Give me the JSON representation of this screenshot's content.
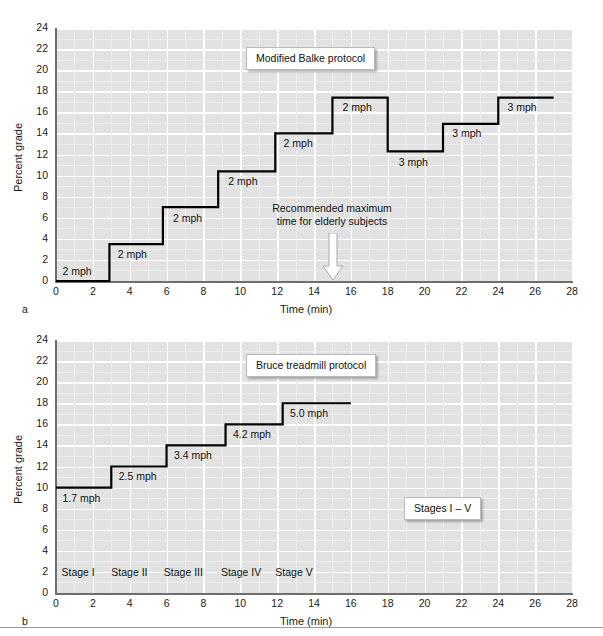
{
  "figure": {
    "width": 603,
    "height": 636,
    "background": "#ffffff",
    "plot_background": "#e2e2e2",
    "grid_color": "#ffffff",
    "line_color": "#000000",
    "axis_color": "#6e6e6e"
  },
  "panels": [
    {
      "id": "a",
      "letter": "a",
      "callout": "Modified Balke protocol",
      "annotation": {
        "line1": "Recommended maximum",
        "line2": "time for elderly subjects",
        "arrow": "down-arrow-icon",
        "at_minute": 15
      },
      "chart_data": {
        "type": "line",
        "subtype": "step",
        "title": "Modified Balke protocol",
        "xlabel": "Time (min)",
        "ylabel": "Percent grade",
        "xlim": [
          0,
          28
        ],
        "ylim": [
          0,
          24
        ],
        "xticks": [
          0,
          2,
          4,
          6,
          8,
          10,
          12,
          14,
          16,
          18,
          20,
          22,
          24,
          26,
          28
        ],
        "yticks": [
          0,
          2,
          4,
          6,
          8,
          10,
          12,
          14,
          16,
          18,
          20,
          22,
          24
        ],
        "grid": true,
        "legend": "none",
        "steps": [
          {
            "t_start": 0.0,
            "t_end": 2.9,
            "grade": 0.0,
            "speed": "2 mph"
          },
          {
            "t_start": 2.9,
            "t_end": 5.8,
            "grade": 3.5,
            "speed": "2 mph"
          },
          {
            "t_start": 5.8,
            "t_end": 8.8,
            "grade": 7.0,
            "speed": "2 mph"
          },
          {
            "t_start": 8.8,
            "t_end": 11.9,
            "grade": 10.4,
            "speed": "2 mph"
          },
          {
            "t_start": 11.9,
            "t_end": 15.0,
            "grade": 14.0,
            "speed": "2 mph"
          },
          {
            "t_start": 15.0,
            "t_end": 18.0,
            "grade": 17.4,
            "speed": "2 mph"
          },
          {
            "t_start": 18.0,
            "t_end": 21.0,
            "grade": 12.3,
            "speed": "3 mph"
          },
          {
            "t_start": 21.0,
            "t_end": 24.0,
            "grade": 14.9,
            "speed": "3 mph"
          },
          {
            "t_start": 24.0,
            "t_end": 27.0,
            "grade": 17.4,
            "speed": "3 mph"
          }
        ],
        "point_labels": [
          {
            "text": "2 mph",
            "t": 0.35,
            "grade": 0.9
          },
          {
            "text": "2 mph",
            "t": 3.35,
            "grade": 2.5
          },
          {
            "text": "2 mph",
            "t": 6.35,
            "grade": 5.9
          },
          {
            "text": "2 mph",
            "t": 9.35,
            "grade": 9.4
          },
          {
            "text": "2 mph",
            "t": 12.35,
            "grade": 13.0
          },
          {
            "text": "2 mph",
            "t": 15.55,
            "grade": 16.4
          },
          {
            "text": "3 mph",
            "t": 18.6,
            "grade": 11.2
          },
          {
            "text": "3 mph",
            "t": 21.5,
            "grade": 13.9
          },
          {
            "text": "3 mph",
            "t": 24.5,
            "grade": 16.4
          }
        ]
      }
    },
    {
      "id": "b",
      "letter": "b",
      "callout": "Bruce treadmill protocol",
      "callout2": "Stages I – V",
      "chart_data": {
        "type": "line",
        "subtype": "step",
        "title": "Bruce treadmill protocol",
        "xlabel": "Time (min)",
        "ylabel": "Percent grade",
        "xlim": [
          0,
          28
        ],
        "ylim": [
          0,
          24
        ],
        "xticks": [
          0,
          2,
          4,
          6,
          8,
          10,
          12,
          14,
          16,
          18,
          20,
          22,
          24,
          26,
          28
        ],
        "yticks": [
          0,
          2,
          4,
          6,
          8,
          10,
          12,
          14,
          16,
          18,
          20,
          22,
          24
        ],
        "grid": true,
        "legend": "none",
        "steps": [
          {
            "t_start": 0.0,
            "t_end": 3.0,
            "grade": 10.0,
            "speed": "1.7 mph",
            "stage": "Stage I"
          },
          {
            "t_start": 3.0,
            "t_end": 6.0,
            "grade": 12.0,
            "speed": "2.5 mph",
            "stage": "Stage II"
          },
          {
            "t_start": 6.0,
            "t_end": 9.2,
            "grade": 14.0,
            "speed": "3.4 mph",
            "stage": "Stage III"
          },
          {
            "t_start": 9.2,
            "t_end": 12.3,
            "grade": 16.0,
            "speed": "4.2 mph",
            "stage": "Stage IV"
          },
          {
            "t_start": 12.3,
            "t_end": 16.0,
            "grade": 18.0,
            "speed": "5.0 mph",
            "stage": "Stage V"
          }
        ],
        "point_labels": [
          {
            "text": "1.7 mph",
            "t": 0.35,
            "grade": 8.9
          },
          {
            "text": "2.5 mph",
            "t": 3.4,
            "grade": 11.0
          },
          {
            "text": "3.4 mph",
            "t": 6.4,
            "grade": 13.0
          },
          {
            "text": "4.2 mph",
            "t": 9.6,
            "grade": 15.0
          },
          {
            "text": "5.0 mph",
            "t": 12.7,
            "grade": 17.0
          }
        ],
        "stage_labels": [
          {
            "text": "Stage I",
            "t": 0.3,
            "grade": 1.9
          },
          {
            "text": "Stage II",
            "t": 3.0,
            "grade": 1.9
          },
          {
            "text": "Stage III",
            "t": 5.85,
            "grade": 1.9
          },
          {
            "text": "Stage IV",
            "t": 8.95,
            "grade": 1.9
          },
          {
            "text": "Stage V",
            "t": 11.9,
            "grade": 1.9
          }
        ]
      }
    }
  ]
}
